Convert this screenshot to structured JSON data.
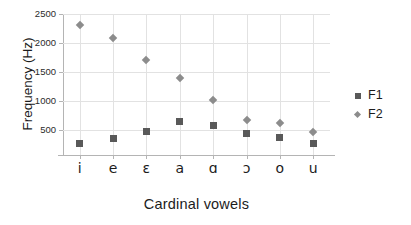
{
  "chart_data": {
    "type": "scatter",
    "title": "",
    "xlabel": "Cardinal vowels",
    "ylabel": "Frequency (Hz)",
    "categories": [
      "i",
      "e",
      "ɛ",
      "a",
      "ɑ",
      "ɔ",
      "o",
      "u"
    ],
    "series": [
      {
        "name": "F1",
        "values": [
          270,
          350,
          470,
          640,
          585,
          440,
          380,
          270
        ],
        "color": "#595959",
        "marker": "square"
      },
      {
        "name": "F2",
        "values": [
          2310,
          2090,
          1700,
          1405,
          1010,
          675,
          620,
          465
        ],
        "color": "#8c8c8c",
        "marker": "diamond"
      }
    ],
    "ylim": [
      0,
      2500
    ],
    "yticks": [
      500,
      1000,
      1500,
      2000,
      2500
    ],
    "ytick_labels": [
      "500",
      "1000",
      "1500",
      "2000",
      "2500"
    ],
    "grid": "both",
    "legend_position": "right",
    "legend_entries": [
      "F1",
      "F2"
    ]
  },
  "axes": {
    "y_title": "Frequency (Hz)",
    "x_title": "Cardinal vowels"
  },
  "legend": {
    "items": [
      {
        "label": "F1",
        "marker": "square-marker-icon"
      },
      {
        "label": "F2",
        "marker": "diamond-marker-icon"
      }
    ]
  }
}
